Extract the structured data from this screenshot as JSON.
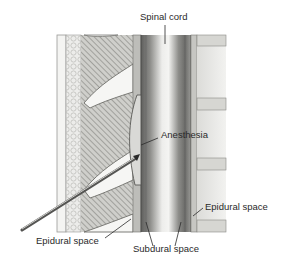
{
  "figure": {
    "labels": {
      "spinal_cord": "Spinal cord",
      "anesthesia": "Anesthesia",
      "epidural_space_right": "Epidural space",
      "epidural_space_left": "Epidural space",
      "subdural_space": "Subdural space"
    }
  },
  "colors": {
    "background": "#ffffff",
    "bone_light": "#e9e9e6",
    "hatch": "#8a8a86",
    "cord_dark": "#6f6f6d",
    "cord_mid": "#9b9b98",
    "cord_light": "#e6e6e4",
    "disc": "#d8d8d4",
    "line": "#3a3a3a"
  }
}
